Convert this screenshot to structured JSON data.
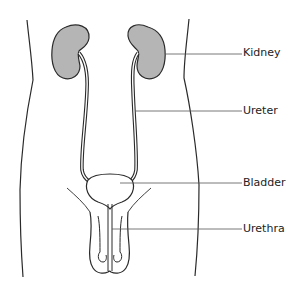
{
  "diagram": {
    "title": "",
    "colors": {
      "outline": "#2a2a2a",
      "kidney_fill": "#b5b5b5",
      "leader_line": "#555555",
      "background": "#ffffff"
    },
    "labels": [
      {
        "id": "kidney",
        "text": "Kidney",
        "x": 243,
        "y": 47
      },
      {
        "id": "ureter",
        "text": "Ureter",
        "x": 243,
        "y": 105
      },
      {
        "id": "bladder",
        "text": "Bladder",
        "x": 243,
        "y": 177
      },
      {
        "id": "urethra",
        "text": "Urethra",
        "x": 243,
        "y": 223
      }
    ]
  }
}
